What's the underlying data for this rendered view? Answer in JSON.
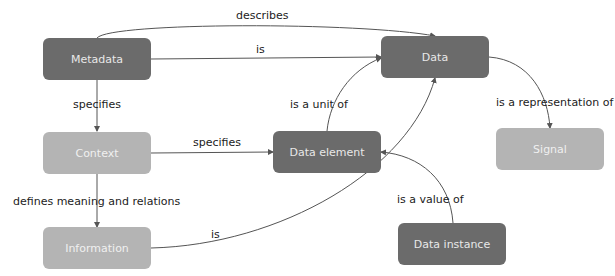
{
  "diagram": {
    "nodes": [
      {
        "id": "metadata",
        "label": "Metadata",
        "shade": "dark"
      },
      {
        "id": "data",
        "label": "Data",
        "shade": "dark"
      },
      {
        "id": "context",
        "label": "Context",
        "shade": "light"
      },
      {
        "id": "data_element",
        "label": "Data element",
        "shade": "dark"
      },
      {
        "id": "signal",
        "label": "Signal",
        "shade": "light"
      },
      {
        "id": "information",
        "label": "Information",
        "shade": "light"
      },
      {
        "id": "data_instance",
        "label": "Data instance",
        "shade": "dark"
      }
    ],
    "edges": [
      {
        "from": "metadata",
        "to": "data",
        "label": "describes"
      },
      {
        "from": "metadata",
        "to": "data",
        "label": "is"
      },
      {
        "from": "metadata",
        "to": "context",
        "label": "specifies"
      },
      {
        "from": "data_element",
        "to": "data",
        "label": "is a unit of"
      },
      {
        "from": "data",
        "to": "signal",
        "label": "is a representation of"
      },
      {
        "from": "context",
        "to": "data_element",
        "label": "specifies"
      },
      {
        "from": "context",
        "to": "information",
        "label": "defines meaning and relations"
      },
      {
        "from": "information",
        "to": "data",
        "label": "is"
      },
      {
        "from": "data_instance",
        "to": "data_element",
        "label": "is a value of"
      }
    ]
  },
  "colors": {
    "dark_node": "#6b6b6b",
    "light_node": "#b4b4b4",
    "edge": "#555555",
    "text": "#222222"
  }
}
